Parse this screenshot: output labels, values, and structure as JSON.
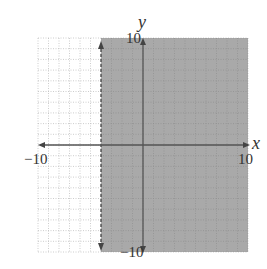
{
  "chart_data": {
    "type": "inequality-graph",
    "title": "",
    "xlabel": "x",
    "ylabel": "y",
    "xlim": [
      -10,
      10
    ],
    "ylim": [
      -10,
      10
    ],
    "grid": true,
    "grid_step": 1,
    "tick_labels": {
      "x_min": "−10",
      "x_max": "10",
      "y_max": "10",
      "y_min": "−10"
    },
    "boundary": {
      "type": "vertical-line",
      "x": -4,
      "style": "dashed"
    },
    "shaded_region": "x > -4",
    "inequality": "x > -4",
    "colors": {
      "shade": "#a9a9a9",
      "grid": "#b8b8b8",
      "axis": "#555555"
    }
  }
}
